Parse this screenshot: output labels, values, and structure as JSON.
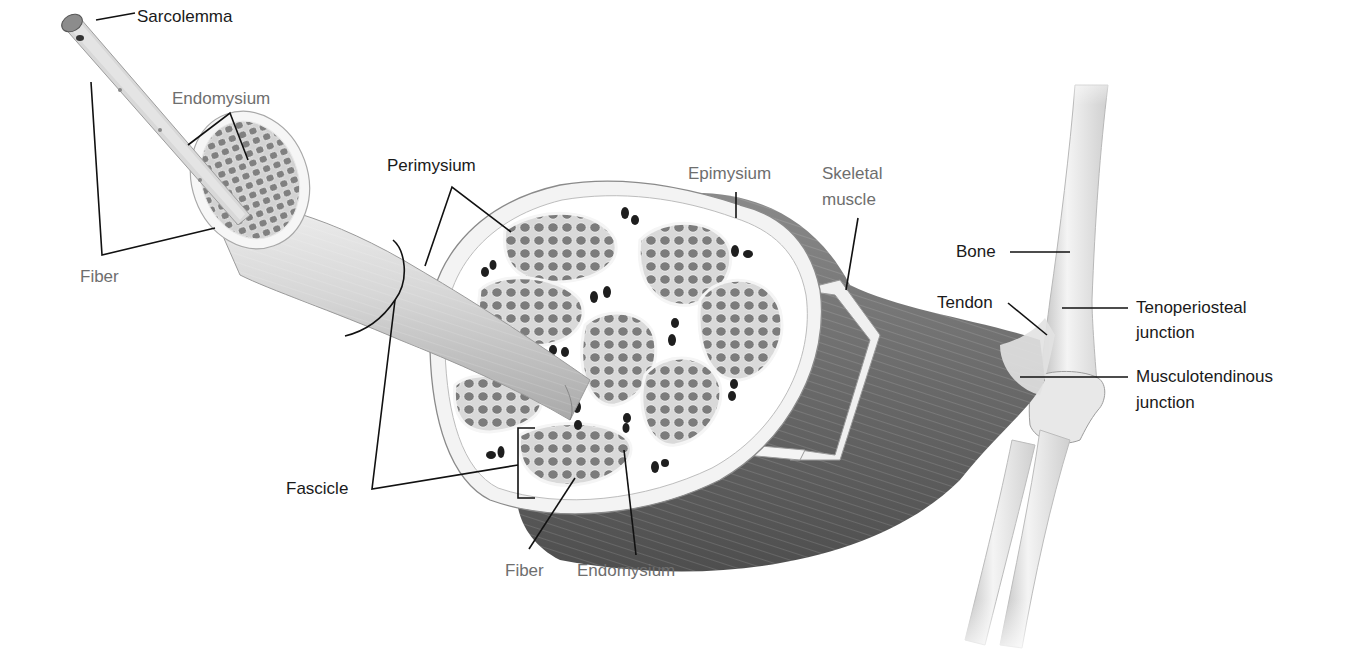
{
  "figure": {
    "colors": {
      "label_primary": "#1a1a1a",
      "label_secondary": "#6e6e6e",
      "muscle_dark": "#5a5a5a",
      "muscle_light": "#cfcfcf",
      "bone": "#e6e6e6",
      "connective_tissue": "#f2f2f2",
      "fiber_fill": "#7a7a7a"
    }
  },
  "labels": {
    "sarcolemma": "Sarcolemma",
    "endomysium_top": "Endomysium",
    "fiber_left": "Fiber",
    "perimysium": "Perimysium",
    "epimysium": "Epimysium",
    "skeletal_muscle_line1": "Skeletal",
    "skeletal_muscle_line2": "muscle",
    "bone": "Bone",
    "tendon": "Tendon",
    "tenoperiosteal_line1": "Tenoperiosteal",
    "tenoperiosteal_line2": "junction",
    "musculotendinous_line1": "Musculotendinous",
    "musculotendinous_line2": "junction",
    "fascicle": "Fascicle",
    "fiber_bottom": "Fiber",
    "endomysium_bottom": "Endomysium"
  }
}
